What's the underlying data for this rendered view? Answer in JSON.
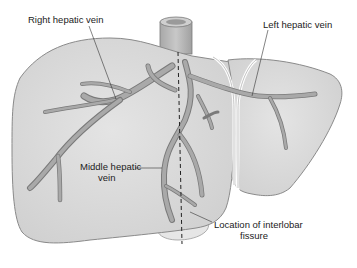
{
  "diagram": {
    "colors": {
      "liver_fill": "#dcdcdc",
      "liver_outline": "#8a8a8a",
      "vein_fill": "#a9a9a9",
      "vein_outline": "#7a7a7a",
      "ivc_fill": "#b8b8b8",
      "ligament": "#ffffff",
      "text": "#222222",
      "leader_line": "#333333"
    },
    "labels": {
      "right_hepatic_vein": "Right hepatic vein",
      "left_hepatic_vein": "Left hepatic vein",
      "middle_hepatic_vein_line1": "Middle hepatic",
      "middle_hepatic_vein_line2": "vein",
      "interlobar_fissure_line1": "Location of interlobar",
      "interlobar_fissure_line2": "fissure"
    }
  }
}
